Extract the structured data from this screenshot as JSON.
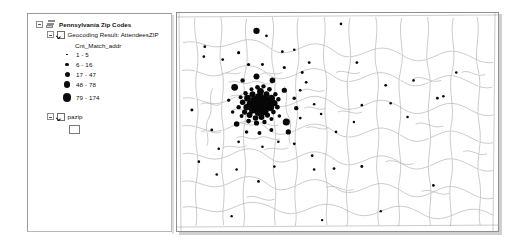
{
  "application": {
    "type": "gis-desktop-map-view"
  },
  "toc": {
    "panel_name": "Table of Contents",
    "layers": [
      {
        "name": "Pennsylvania Zip Codes",
        "is_group": true,
        "expanded": true,
        "bold": true,
        "icon": "layer-stack-icon"
      },
      {
        "name": "Geocoding Result: AttendeesZIP",
        "expanded": true,
        "checked": true,
        "field_label": "Cnt_Match_addr",
        "symbology": "graduated-symbols",
        "classes": [
          {
            "label": "1 - 5",
            "dot_px": 1.8,
            "color": "#0d0d0d"
          },
          {
            "label": "6 - 16",
            "dot_px": 3.2,
            "color": "#0d0d0d"
          },
          {
            "label": "17 - 47",
            "dot_px": 5.0,
            "color": "#0d0d0d"
          },
          {
            "label": "48 - 78",
            "dot_px": 6.4,
            "color": "#0d0d0d"
          },
          {
            "label": "79 - 174",
            "dot_px": 8.6,
            "color": "#0d0d0d"
          }
        ]
      },
      {
        "name": "pazip",
        "expanded": true,
        "checked": true,
        "swatch": "hollow-polygon"
      }
    ]
  },
  "map": {
    "name": "map-frame",
    "basemap_layer": "pazip",
    "point_layer": "Geocoding Result: AttendeesZIP",
    "polygon_fill": "#ffffff",
    "polygon_stroke": "#8d8d8d",
    "point_color": "#070707",
    "cluster_note": "dense point cluster in west-central portion of extent"
  }
}
